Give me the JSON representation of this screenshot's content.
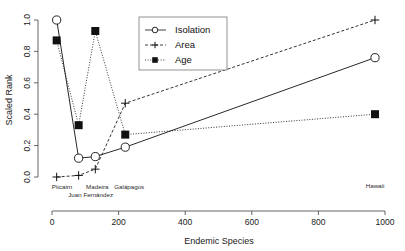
{
  "chart_data": {
    "type": "line",
    "title": "",
    "xlabel": "Endemic Species",
    "ylabel": "Scaled Rank",
    "xlim": [
      0,
      1000
    ],
    "ylim": [
      0.0,
      1.0
    ],
    "grid": false,
    "legend_position": "top-center",
    "x": [
      14,
      80,
      130,
      220,
      970
    ],
    "point_labels": [
      "Pitcairn",
      "Juan Fernández",
      "Madeira",
      "Galápagos",
      "Hawaii"
    ],
    "xticks": [
      "0",
      "200",
      "400",
      "600",
      "800",
      "1000"
    ],
    "xtick_values": [
      0,
      200,
      400,
      600,
      800,
      1000
    ],
    "yticks": [
      "0.0",
      "0.2",
      "0.4",
      "0.6",
      "0.8",
      "1.0"
    ],
    "ytick_values": [
      0.0,
      0.2,
      0.4,
      0.6,
      0.8,
      1.0
    ],
    "series": [
      {
        "name": "Isolation",
        "marker": "open-circle",
        "linestyle": "solid",
        "color": "#111111",
        "values": [
          1.0,
          0.12,
          0.13,
          0.19,
          0.76
        ]
      },
      {
        "name": "Area",
        "marker": "plus",
        "linestyle": "dashed",
        "color": "#111111",
        "values": [
          0.0,
          0.01,
          0.05,
          0.47,
          1.0
        ]
      },
      {
        "name": "Age",
        "marker": "filled-square",
        "linestyle": "dotted",
        "color": "#111111",
        "values": [
          0.87,
          0.33,
          0.93,
          0.27,
          0.4
        ]
      }
    ]
  },
  "legend": {
    "entries": [
      {
        "label": "Isolation"
      },
      {
        "label": "Area"
      },
      {
        "label": "Age"
      }
    ]
  },
  "axes": {
    "x_title": "Endemic Species",
    "y_title": "Scaled Rank"
  }
}
